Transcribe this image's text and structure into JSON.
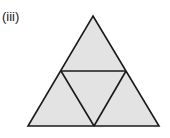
{
  "figure": {
    "label": "(iii)",
    "fill_color": "#e3e3e3",
    "stroke_color": "#1a1a1a",
    "subdivisions": 4
  }
}
